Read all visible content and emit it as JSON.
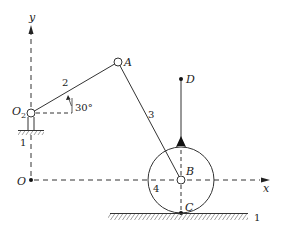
{
  "diagram": {
    "type": "mechanism",
    "axes": {
      "x_label": "x",
      "y_label": "y",
      "origin_label": "O"
    },
    "points": {
      "O2": "O",
      "O2_sub": "2",
      "A": "A",
      "B": "B",
      "C": "C",
      "D": "D"
    },
    "links": {
      "crank": "2",
      "coupler": "3",
      "wheel": "4",
      "ground_left": "1",
      "ground_right": "1"
    },
    "angle": {
      "value": "30°"
    }
  }
}
